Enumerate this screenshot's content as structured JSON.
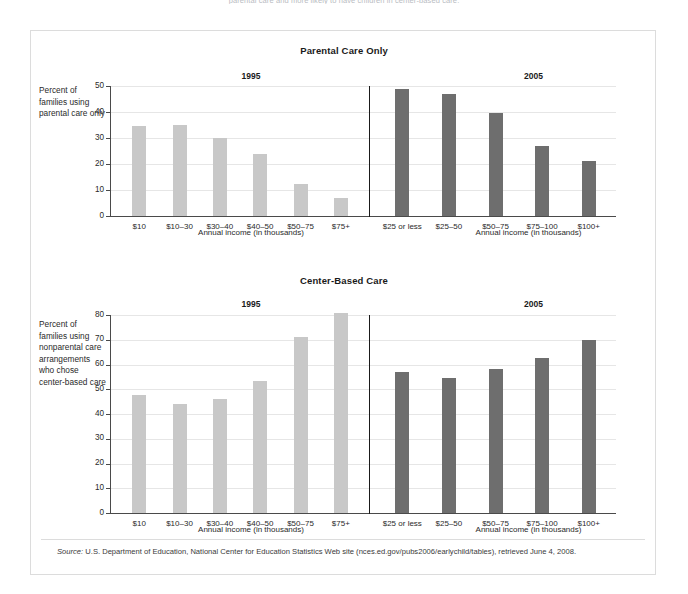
{
  "top_cut_text": "parental care and more likely to have children in center-based care.",
  "source": {
    "label": "Source:",
    "text": " U.S. Department of Education, National Center for Education Statistics Web site (nces.ed.gov/pubs2006/earlychild/tables), retrieved June 4, 2008."
  },
  "colors": {
    "bar_1995": "#c8c8c8",
    "bar_2005": "#6e6e6e",
    "grid": "#e6e6e6",
    "axis": "#4a4a4a",
    "divider": "#1a1a1a",
    "frame": "#dcdcdc"
  },
  "chart_data": [
    {
      "type": "bar",
      "title": "Parental Care Only",
      "ylabel": "Percent of families using parental care only",
      "xlabel": "Annual income (in thousands)",
      "ylim": [
        0,
        50
      ],
      "yticks": [
        0,
        10,
        20,
        30,
        40,
        50
      ],
      "grid": true,
      "legend_position": "none",
      "panels": [
        {
          "name": "1995",
          "categories": [
            "$10",
            "$10–30",
            "$30–40",
            "$40–50",
            "$50–75",
            "$75+"
          ],
          "values": [
            34.5,
            35,
            30,
            24,
            12.5,
            7
          ],
          "color": "#c8c8c8"
        },
        {
          "name": "2005",
          "categories": [
            "$25 or less",
            "$25–50",
            "$50–75",
            "$75–100",
            "$100+"
          ],
          "values": [
            49,
            47,
            39.5,
            27,
            21
          ],
          "color": "#6e6e6e"
        }
      ]
    },
    {
      "type": "bar",
      "title": "Center-Based Care",
      "ylabel": "Percent of families using nonparental care arrangements who chose center-based care",
      "xlabel": "Annual income (in thousands)",
      "ylim": [
        0,
        80
      ],
      "yticks": [
        0,
        10,
        20,
        30,
        40,
        50,
        60,
        70,
        80
      ],
      "grid": true,
      "legend_position": "none",
      "panels": [
        {
          "name": "1995",
          "categories": [
            "$10",
            "$10–30",
            "$30–40",
            "$40–50",
            "$50–75",
            "$75+"
          ],
          "values": [
            47.5,
            44,
            46,
            53.5,
            71,
            81
          ],
          "color": "#c8c8c8"
        },
        {
          "name": "2005",
          "categories": [
            "$25 or less",
            "$25–50",
            "$50–75",
            "$75–100",
            "$100+"
          ],
          "values": [
            57,
            54.5,
            58,
            62.5,
            70
          ],
          "color": "#6e6e6e"
        }
      ]
    }
  ],
  "ylabel_lines": {
    "top": [
      "Percent of",
      "families using",
      "parental care only"
    ],
    "bottom": [
      "Percent of",
      "families using",
      "nonparental care",
      "arrangements",
      "who chose",
      "center-based care"
    ]
  }
}
